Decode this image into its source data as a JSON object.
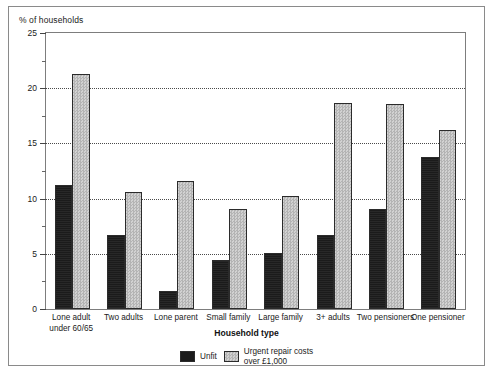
{
  "figure": {
    "y_unit_caption": "% of households",
    "x_axis_title": "Household type"
  },
  "legend": {
    "entries": [
      {
        "label_line1": "Unfit",
        "label_line2": "",
        "color": "#1b1b1b",
        "swatch": "unfit"
      },
      {
        "label_line1": "Urgent repair costs",
        "label_line2": "over £1,000",
        "color": "#c2c2c2",
        "swatch": "urgent"
      }
    ]
  },
  "chart_data": {
    "type": "bar",
    "title": "",
    "subtitle": "",
    "xlabel": "Household type",
    "ylabel": "% of households",
    "ylim": [
      0,
      25
    ],
    "ytick_labels": [
      "0",
      "5",
      "10",
      "15",
      "20",
      "25"
    ],
    "ytick_values": [
      0,
      5,
      10,
      15,
      20,
      25
    ],
    "yminor_values": [
      2.5,
      7.5,
      12.5,
      17.5,
      22.5
    ],
    "grid": "horizontal-dotted",
    "legend_position": "bottom-center",
    "categories": [
      "Lone adult under 60/65",
      "Two adults",
      "Lone parent",
      "Small family",
      "Large family",
      "3+ adults",
      "Two pensioners",
      "One pensioner"
    ],
    "category_lines": [
      [
        "Lone adult",
        "under 60/65"
      ],
      [
        "Two adults",
        ""
      ],
      [
        "Lone parent",
        ""
      ],
      [
        "Small family",
        ""
      ],
      [
        "Large family",
        ""
      ],
      [
        "3+ adults",
        ""
      ],
      [
        "Two pensioners",
        ""
      ],
      [
        "One pensioner",
        ""
      ]
    ],
    "series": [
      {
        "name": "Unfit",
        "color": "#1b1b1b",
        "values": [
          11.2,
          6.7,
          1.6,
          4.4,
          5.1,
          6.7,
          9.1,
          13.8
        ]
      },
      {
        "name": "Urgent repair costs over £1,000",
        "color": "#c2c2c2",
        "values": [
          21.3,
          10.6,
          11.6,
          9.1,
          10.2,
          18.7,
          18.6,
          16.2
        ]
      }
    ]
  }
}
